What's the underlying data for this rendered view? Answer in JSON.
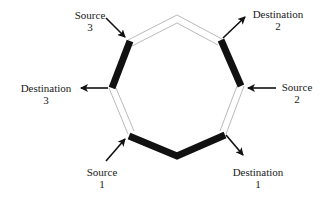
{
  "diagram": {
    "type": "ring-network",
    "shape": "octagon",
    "colors": {
      "thin_edge": "#a8a8a8",
      "thick_edge": "#111111",
      "arrow": "#111111",
      "text": "#1a1a1a",
      "background": "#ffffff"
    },
    "nodes": [
      {
        "id": "top",
        "x": 177,
        "y": 15
      },
      {
        "id": "upper-right",
        "x": 222,
        "y": 39
      },
      {
        "id": "right",
        "x": 244,
        "y": 86
      },
      {
        "id": "lower-right",
        "x": 226,
        "y": 134
      },
      {
        "id": "bottom",
        "x": 177,
        "y": 157
      },
      {
        "id": "lower-left",
        "x": 128,
        "y": 134
      },
      {
        "id": "left",
        "x": 109,
        "y": 88
      },
      {
        "id": "upper-left",
        "x": 128,
        "y": 40
      }
    ],
    "edges": [
      {
        "from": "top",
        "to": "upper-right",
        "style": "thin"
      },
      {
        "from": "upper-right",
        "to": "right",
        "style": "thick"
      },
      {
        "from": "right",
        "to": "lower-right",
        "style": "thin"
      },
      {
        "from": "lower-right",
        "to": "bottom",
        "style": "thick"
      },
      {
        "from": "bottom",
        "to": "lower-left",
        "style": "thick"
      },
      {
        "from": "lower-left",
        "to": "left",
        "style": "thin"
      },
      {
        "from": "left",
        "to": "upper-left",
        "style": "thick"
      },
      {
        "from": "upper-left",
        "to": "top",
        "style": "thin"
      }
    ],
    "labels": {
      "source3": {
        "line1": "Source",
        "line2": "3"
      },
      "destination3": {
        "line1": "Destination",
        "line2": "3"
      },
      "destination2": {
        "line1": "Destination",
        "line2": "2"
      },
      "source2": {
        "line1": "Source",
        "line2": "2"
      },
      "source1": {
        "line1": "Source",
        "line2": "1"
      },
      "destination1": {
        "line1": "Destination",
        "line2": "1"
      }
    },
    "connections": [
      {
        "label": "Source 3",
        "node": "upper-left",
        "direction": "in"
      },
      {
        "label": "Destination 3",
        "node": "left",
        "direction": "out"
      },
      {
        "label": "Destination 2",
        "node": "upper-right",
        "direction": "out"
      },
      {
        "label": "Source 2",
        "node": "right",
        "direction": "in"
      },
      {
        "label": "Source 1",
        "node": "lower-left",
        "direction": "in"
      },
      {
        "label": "Destination 1",
        "node": "lower-right",
        "direction": "out"
      }
    ]
  }
}
